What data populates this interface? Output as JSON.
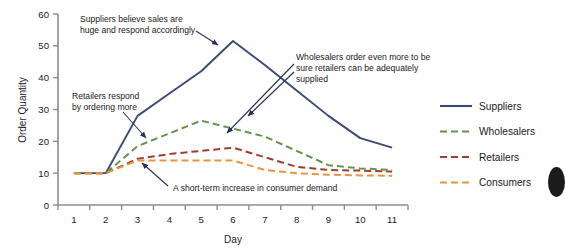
{
  "chart_data": {
    "type": "line",
    "title": "",
    "xlabel": "Day",
    "ylabel": "Order Quantity",
    "x": [
      1,
      2,
      3,
      4,
      5,
      6,
      7,
      8,
      9,
      10,
      11
    ],
    "xlim": [
      1,
      11
    ],
    "ylim": [
      0,
      60
    ],
    "yticks": [
      0,
      10,
      20,
      30,
      40,
      50,
      60
    ],
    "xticks": [
      1,
      2,
      3,
      4,
      5,
      6,
      7,
      8,
      9,
      10,
      11
    ],
    "grid": false,
    "legend_position": "right",
    "series": [
      {
        "name": "Suppliers",
        "color": "#3a4a78",
        "style": "solid",
        "values": [
          10,
          10,
          28,
          35,
          42,
          51.5,
          44,
          36,
          28,
          21,
          18
        ]
      },
      {
        "name": "Wholesalers",
        "color": "#67944a",
        "style": "dashed",
        "values": [
          10,
          10,
          18.5,
          22.5,
          26.5,
          24,
          21.5,
          17,
          12.5,
          11.5,
          11
        ]
      },
      {
        "name": "Retailers",
        "color": "#9e3d33",
        "style": "dashed",
        "values": [
          10,
          10,
          14.5,
          16,
          17,
          18,
          15,
          12,
          11,
          10.8,
          10.5
        ]
      },
      {
        "name": "Consumers",
        "color": "#e8963c",
        "style": "dashed",
        "values": [
          10,
          10,
          14,
          14,
          14,
          14,
          11,
          10,
          9.5,
          9.3,
          9.2
        ]
      }
    ],
    "annotations": [
      {
        "id": "suppliers-note",
        "lines": [
          "Suppliers believe sales are",
          "huge and respond accordingly"
        ]
      },
      {
        "id": "wholesalers-note",
        "lines": [
          "Wholesalers order even more to be",
          "sure retailers can be adequately",
          "supplied"
        ]
      },
      {
        "id": "retailers-note",
        "lines": [
          "Retailers respond",
          "by ordering more"
        ]
      },
      {
        "id": "consumers-note",
        "lines": [
          "A short-term increase in consumer demand"
        ]
      }
    ]
  },
  "legend": {
    "items": [
      {
        "label": "Suppliers"
      },
      {
        "label": "Wholesalers"
      },
      {
        "label": "Retailers"
      },
      {
        "label": "Consumers"
      }
    ]
  },
  "axes": {
    "y_title": "Order Quantity",
    "x_title": "Day",
    "y_tick_labels": [
      "0",
      "10",
      "20",
      "30",
      "40",
      "50",
      "60"
    ],
    "x_tick_labels": [
      "1",
      "2",
      "3",
      "4",
      "5",
      "6",
      "7",
      "8",
      "9",
      "10",
      "11"
    ]
  }
}
